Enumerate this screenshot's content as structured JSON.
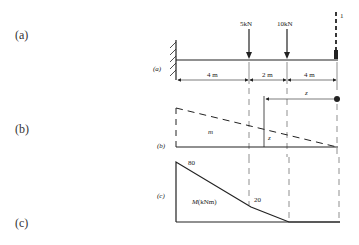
{
  "outer_labels": {
    "a": "(a)",
    "b": "(b)",
    "c": "(c)"
  },
  "panel_a": {
    "label": "(a)",
    "loads": [
      {
        "label": "5kN",
        "x_m": 4
      },
      {
        "label": "10kN",
        "x_m": 6
      },
      {
        "label": "1",
        "x_m": 10,
        "style": "dashed-unit-load"
      }
    ],
    "dimensions": [
      "4 m",
      "2 m",
      "4 m"
    ],
    "support": "fixed-wall"
  },
  "panel_b": {
    "label": "(b)",
    "area_label": "m",
    "ordinate_label": "z",
    "distance_label": "z"
  },
  "panel_c": {
    "label": "(c)",
    "area_label": "M(kNm)",
    "values": [
      {
        "label": "80",
        "x_m": 0
      },
      {
        "label": "20",
        "x_m": 4
      }
    ]
  }
}
